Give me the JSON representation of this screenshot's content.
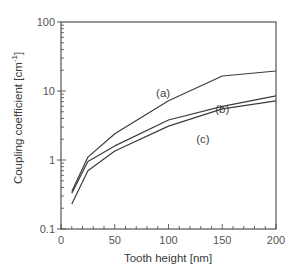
{
  "chart_data": {
    "type": "line",
    "title": "",
    "xlabel": "Tooth height [nm]",
    "ylabel": "Coupling coefficient [cm",
    "ylabel_superscript": "-1",
    "ylabel_suffix": "]",
    "xlim": [
      0,
      200
    ],
    "ylim": [
      0.1,
      100
    ],
    "yscale": "log",
    "grid": false,
    "legend": "inline labels",
    "x_ticks": [
      0,
      50,
      100,
      150,
      200
    ],
    "x_tick_labels": [
      "0",
      "50",
      "100",
      "150",
      "200"
    ],
    "y_ticks": [
      0.1,
      1,
      10,
      100
    ],
    "y_tick_labels": [
      "0.1",
      "1",
      "10",
      "100"
    ],
    "x": [
      10,
      25,
      50,
      100,
      150,
      200
    ],
    "series": [
      {
        "name": "(a)",
        "values": [
          0.35,
          1.1,
          2.4,
          7.2,
          16.5,
          19.5
        ]
      },
      {
        "name": "(b)",
        "values": [
          0.33,
          0.95,
          1.6,
          3.8,
          6.0,
          8.5
        ]
      },
      {
        "name": "(c)",
        "values": [
          0.23,
          0.7,
          1.35,
          3.1,
          5.5,
          7.2
        ]
      }
    ],
    "series_label_positions": [
      {
        "name": "(a)",
        "x": 95,
        "y": 9.5
      },
      {
        "name": "(b)",
        "x": 150,
        "y": 5.5
      },
      {
        "name": "(c)",
        "x": 132,
        "y": 2.0
      }
    ]
  },
  "colors": {
    "line": "#3c3c3c",
    "axis": "#444444",
    "text": "#555555"
  }
}
